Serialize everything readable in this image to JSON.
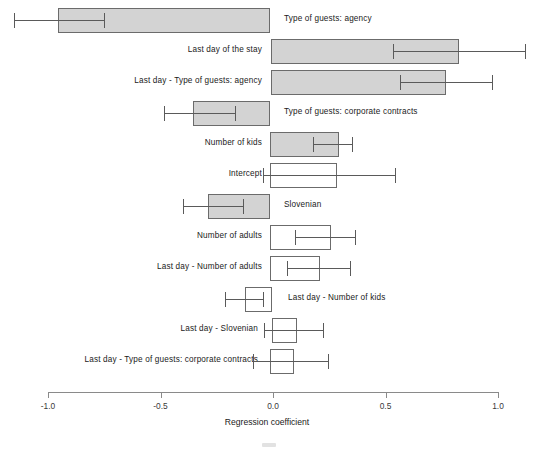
{
  "chart_data": {
    "type": "bar",
    "orientation": "horizontal",
    "title": "",
    "xlabel": "Regression coefficient",
    "ylabel": "",
    "xlim": [
      -1.0,
      1.0
    ],
    "xticks": [
      -1.0,
      -0.5,
      0.0,
      0.5,
      1.0
    ],
    "xtick_labels": [
      "-1.0",
      "-0.5",
      "0.0",
      "0.5",
      "1.0"
    ],
    "grid": false,
    "legend": "none",
    "note": "Horizontal bar chart of regression coefficients with error bars (confidence intervals). Bars start at 0.0 except where shown; shaded grey bars appear for larger-magnitude coefficients, hollow/white bars for smaller ones.",
    "categories": [
      "Type of guests: agency",
      "Last day of the stay",
      "Last day - Type of guests: agency",
      "Type of guests: corporate contracts",
      "Number of kids",
      "Intercept",
      "Slovenian",
      "Number of adults",
      "Last day - Number of adults",
      "Last day - Number of kids",
      "Last day - Slovenian",
      "Last day - Type of guests: corporate contracts"
    ],
    "values": [
      -0.955,
      0.827,
      0.769,
      -0.342,
      0.293,
      0.284,
      -0.276,
      0.258,
      0.209,
      -0.124,
      0.107,
      0.093
    ],
    "err_low": [
      -1.15,
      0.533,
      0.564,
      -0.484,
      0.178,
      -0.044,
      -0.4,
      0.098,
      0.062,
      -0.213,
      -0.04,
      -0.089
    ],
    "err_high": [
      -0.751,
      1.12,
      0.973,
      -0.169,
      0.351,
      0.542,
      -0.133,
      0.364,
      0.342,
      -0.044,
      0.222,
      0.244
    ],
    "bars": [
      {
        "label": "Type of guests: agency",
        "value": -0.955,
        "bar_start": -0.955,
        "bar_end": -0.013,
        "err_low": -1.15,
        "err_high": -0.751,
        "fill": "grey",
        "label_side": "right",
        "label_x": 284
      },
      {
        "label": "Last day of the stay",
        "value": 0.827,
        "bar_start": -0.009,
        "bar_end": 0.827,
        "err_low": 0.533,
        "err_high": 1.12,
        "fill": "grey",
        "label_side": "left",
        "label_x": 262
      },
      {
        "label": "Last day - Type of guests: agency",
        "value": 0.769,
        "bar_start": -0.009,
        "bar_end": 0.769,
        "err_low": 0.564,
        "err_high": 0.973,
        "fill": "grey",
        "label_side": "left",
        "label_x": 262
      },
      {
        "label": "Type of guests: corporate contracts",
        "value": -0.342,
        "bar_start": -0.356,
        "bar_end": -0.013,
        "err_low": -0.484,
        "err_high": -0.169,
        "fill": "grey",
        "label_side": "right",
        "label_x": 284
      },
      {
        "label": "Number of kids",
        "value": 0.293,
        "bar_start": -0.013,
        "bar_end": 0.293,
        "err_low": 0.178,
        "err_high": 0.351,
        "fill": "grey",
        "label_side": "left",
        "label_x": 262
      },
      {
        "label": "Intercept",
        "value": 0.284,
        "bar_start": -0.013,
        "bar_end": 0.284,
        "err_low": -0.044,
        "err_high": 0.542,
        "fill": "white",
        "label_side": "left",
        "label_x": 262
      },
      {
        "label": "Slovenian",
        "value": -0.276,
        "bar_start": -0.289,
        "bar_end": -0.013,
        "err_low": -0.4,
        "err_high": -0.133,
        "fill": "grey",
        "label_side": "right",
        "label_x": 284
      },
      {
        "label": "Number of adults",
        "value": 0.258,
        "bar_start": -0.013,
        "bar_end": 0.258,
        "err_low": 0.098,
        "err_high": 0.364,
        "fill": "white",
        "label_side": "left",
        "label_x": 262
      },
      {
        "label": "Last day - Number of adults",
        "value": 0.209,
        "bar_start": -0.013,
        "bar_end": 0.209,
        "err_low": 0.062,
        "err_high": 0.342,
        "fill": "white",
        "label_side": "left",
        "label_x": 262
      },
      {
        "label": "Last day - Number of kids",
        "value": -0.124,
        "bar_start": -0.124,
        "bar_end": -0.004,
        "err_low": -0.213,
        "err_high": -0.044,
        "fill": "white",
        "label_side": "right",
        "label_x": 288
      },
      {
        "label": "Last day - Slovenian",
        "value": 0.107,
        "bar_start": -0.004,
        "bar_end": 0.107,
        "err_low": -0.04,
        "err_high": 0.222,
        "fill": "white",
        "label_side": "left",
        "label_x": 258
      },
      {
        "label": "Last day - Type of guests: corporate contracts",
        "value": 0.093,
        "bar_start": -0.013,
        "bar_end": 0.093,
        "err_low": -0.089,
        "err_high": 0.244,
        "fill": "white",
        "label_side": "left",
        "label_x": 258
      }
    ]
  },
  "axis": {
    "title": "Regression coefficient",
    "ticks": [
      {
        "value": -1.0,
        "label": "-1.0"
      },
      {
        "value": -0.5,
        "label": "-0.5"
      },
      {
        "value": 0.0,
        "label": "0.0"
      },
      {
        "value": 0.5,
        "label": "0.5"
      },
      {
        "value": 1.0,
        "label": "1.0"
      }
    ]
  },
  "colors": {
    "bar_fill_grey": "#d3d3d3",
    "bar_fill_white": "#ffffff",
    "bar_border": "#6b6b6b",
    "error_bar": "#5a5a5a",
    "axis": "#8a8a8a",
    "text": "#1a1a1a",
    "background": "#ffffff"
  }
}
